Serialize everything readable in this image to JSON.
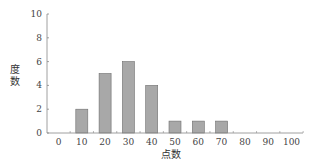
{
  "chart_data": {
    "type": "bar",
    "title": "",
    "xlabel": "点数",
    "ylabel": "度数",
    "categories": [
      "0",
      "10",
      "20",
      "30",
      "40",
      "50",
      "60",
      "70",
      "80",
      "90",
      "100"
    ],
    "values": [
      0,
      2,
      5,
      6,
      4,
      1,
      1,
      1,
      0,
      0,
      0
    ],
    "ylim": [
      0,
      10
    ],
    "yticks": [
      0,
      2,
      4,
      6,
      8,
      10
    ],
    "xticks": [
      0,
      10,
      20,
      30,
      40,
      50,
      60,
      70,
      80,
      90,
      100
    ],
    "grid": false,
    "legend": null,
    "bar_color": "#a8a8a8",
    "bar_edge_color": "#6e6e6e",
    "axis_color": "#888888"
  }
}
